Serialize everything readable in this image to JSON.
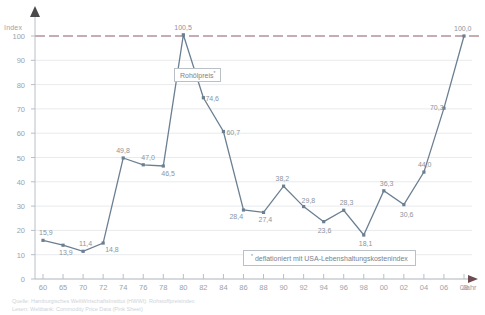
{
  "chart_data": {
    "type": "line",
    "title": "",
    "subtitle": "",
    "xlabel": "Jahr",
    "ylabel": "Index",
    "ylim": [
      0,
      100
    ],
    "yticks": [
      0,
      10,
      20,
      30,
      40,
      50,
      60,
      70,
      80,
      90,
      100
    ],
    "grid": true,
    "legend_position": "inline-annotation",
    "categories": [
      "60",
      "65",
      "70",
      "72",
      "74",
      "76",
      "78",
      "80",
      "82",
      "84",
      "86",
      "88",
      "90",
      "92",
      "94",
      "96",
      "98",
      "00",
      "02",
      "04",
      "06",
      "08"
    ],
    "xticks": [
      "60",
      "65",
      "70",
      "72",
      "74",
      "76",
      "78",
      "80",
      "82",
      "84",
      "86",
      "88",
      "90",
      "92",
      "94",
      "96",
      "98",
      "00",
      "02",
      "04",
      "06",
      "08"
    ],
    "series": [
      {
        "name": "Rohölpreis *",
        "values": [
          15.9,
          13.9,
          11.4,
          14.8,
          49.8,
          47.0,
          46.5,
          100.5,
          74.6,
          60.7,
          28.4,
          27.4,
          38.2,
          29.8,
          23.6,
          28.3,
          18.1,
          36.3,
          30.6,
          44.0,
          70.3,
          100.0
        ],
        "value_labels": [
          "15,9",
          "13,9",
          "11,4",
          "14,8",
          "49,8",
          "47,0",
          "46,5",
          "100,5",
          "74,6",
          "60,7",
          "28,4",
          "27,4",
          "38,2",
          "29,8",
          "23,6",
          "28,3",
          "18,1",
          "36,3",
          "30,6",
          "44,0",
          "70,3",
          "100,0"
        ],
        "color": "#6b7f92"
      }
    ],
    "reference_line": {
      "value": 100,
      "style": "dashed",
      "color": "#8c5d64"
    },
    "annotations": [
      {
        "name": "series-label",
        "text": "Rohölpreis",
        "marker": "*"
      },
      {
        "name": "footnote",
        "text": "deflationiert mit USA-Lebenshaltungskostenindex",
        "marker": "*"
      }
    ]
  },
  "axes": {
    "y_title": "Index",
    "x_title": "Jahr"
  },
  "source": {
    "line1": "Quelle: Hamburgisches WeltWirtschaftsInstitut (HWWI): Rohstoffpreisindex",
    "line2": "Lesen: Weltbank: Commodity Price Data (Pink Sheet)"
  },
  "colors": {
    "series": "#6b7f92",
    "reference": "#8c5d64",
    "grid": "#e8eaec",
    "axis": "#b9bfc6",
    "text": "#9aa3ad",
    "label": "#8d949c"
  }
}
